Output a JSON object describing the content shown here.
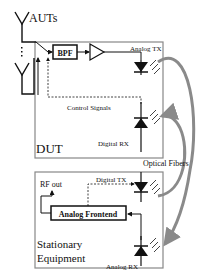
{
  "diagram": {
    "antennas_label": "AUTs",
    "dut": {
      "label": "DUT",
      "bpf_label": "BPF",
      "analog_tx_label": "Analog TX",
      "control_signals_label": "Control Signals",
      "digital_rx_label": "Digital RX"
    },
    "optical_fibers_label": "Optical Fibers",
    "stationary": {
      "label_line1": "Stationary",
      "label_line2": "Equipment",
      "digital_tx_label": "Digital TX",
      "rf_out_label": "RF out",
      "frontend_label": "Analog Frontend",
      "analog_rx_label": "Analog RX"
    },
    "colors": {
      "line": "#111111",
      "box_border": "#888888",
      "fiber": "#8a8a8a"
    }
  }
}
